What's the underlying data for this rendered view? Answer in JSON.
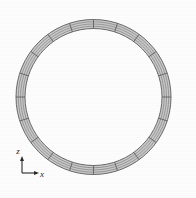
{
  "figure": {
    "background_color": "#fdfdfd",
    "mesh_line_color": "#6e6e6e",
    "mesh_fill_color": "#c9c9c9",
    "interior_color": "#ffffff"
  },
  "mesh": {
    "shape": "annulus",
    "center_x": 93.5,
    "center_y": 97.0,
    "outer_radius": 77.5,
    "inner_radius": 68.5,
    "circumferential_divisions": 20,
    "radial_layers": 4
  },
  "axis_triad": {
    "origin_x": 22,
    "origin_y": 173,
    "arm_length": 15,
    "z_label": "z",
    "x_label": "x",
    "color": "#2a2a2a"
  },
  "chart_data": {
    "type": "diagram",
    "geometry": "annulus",
    "center": [
      93.5,
      97.0
    ],
    "outer_radius": 77.5,
    "inner_radius": 68.5,
    "wall_thickness": 9.0,
    "circumferential_divisions": 20,
    "radial_layers": 4,
    "total_elements": 80,
    "axes": [
      "x",
      "z"
    ],
    "axis_origin": [
      22,
      173
    ],
    "xlabel": "x",
    "ylabel": "z",
    "legend": [],
    "grid": false
  }
}
